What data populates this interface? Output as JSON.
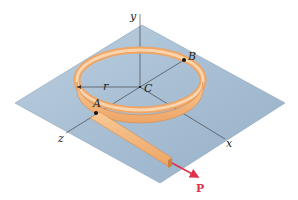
{
  "diagram": {
    "type": "mechanics-figure",
    "labels": {
      "y_axis": "y",
      "x_axis": "x",
      "z_axis": "z",
      "center": "C",
      "point_a": "A",
      "point_b": "B",
      "radius": "r",
      "force": "P"
    },
    "colors": {
      "plane": "#a9bfd3",
      "plane_edge": "#7f98ae",
      "strip": "#f2b478",
      "strip_edge": "#d9894a",
      "strip_inner": "#f8d4ad",
      "force": "#e0314a",
      "axis": "#333333"
    }
  }
}
